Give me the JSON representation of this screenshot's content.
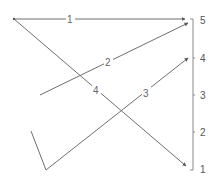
{
  "diagram": {
    "axis": {
      "ticks": [
        {
          "label": "5",
          "y": 20
        },
        {
          "label": "4",
          "y": 58
        },
        {
          "label": "3",
          "y": 95
        },
        {
          "label": "2",
          "y": 132
        },
        {
          "label": "1",
          "y": 169
        }
      ]
    },
    "edges": [
      {
        "label": "1",
        "from": [
          14,
          19
        ],
        "to": [
          185,
          19
        ],
        "label_pos": [
          70,
          22
        ]
      },
      {
        "label": "2",
        "from": [
          40,
          95
        ],
        "to": [
          188,
          23
        ],
        "label_pos": [
          108,
          66
        ]
      },
      {
        "label": "3",
        "from": [
          46,
          170
        ],
        "to": [
          188,
          58
        ],
        "label_pos": [
          146,
          97
        ]
      },
      {
        "label": "4",
        "from": [
          14,
          19
        ],
        "to": [
          188,
          167
        ],
        "label_pos": [
          96,
          93
        ]
      }
    ],
    "extra_segment": {
      "from": [
        31,
        131
      ],
      "to": [
        46,
        170
      ]
    },
    "colors": {
      "line": "#6f6f6f",
      "axis": "#8a8a8a",
      "text": "#666666"
    }
  }
}
